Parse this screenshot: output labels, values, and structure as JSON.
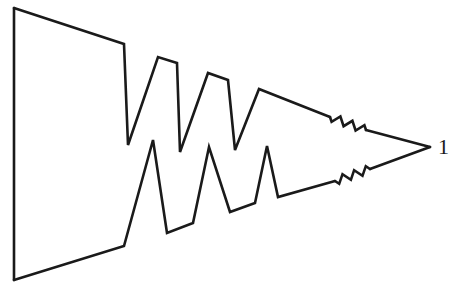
{
  "diagram": {
    "type": "line-drawing",
    "stroke_color": "#1a1a1a",
    "background": "#ffffff",
    "label": "1",
    "paths": {
      "top": [
        [
          14,
          8
        ],
        [
          124,
          44
        ],
        [
          128,
          145
        ],
        [
          158,
          57
        ],
        [
          177,
          63
        ],
        [
          180,
          152
        ],
        [
          208,
          73
        ],
        [
          228,
          80
        ],
        [
          235,
          150
        ],
        [
          259,
          89
        ],
        [
          330,
          117
        ]
      ],
      "top_spring": {
        "from": [
          330,
          117
        ],
        "to": [
          366,
          130
        ],
        "teeth": 3
      },
      "top_tail": [
        [
          366,
          130
        ],
        [
          430,
          147
        ]
      ],
      "bottom": [
        [
          14,
          280
        ],
        [
          124,
          246
        ],
        [
          153,
          140
        ],
        [
          167,
          233
        ],
        [
          193,
          223
        ],
        [
          209,
          147
        ],
        [
          230,
          212
        ],
        [
          255,
          203
        ],
        [
          267,
          146
        ],
        [
          278,
          197
        ],
        [
          335,
          181
        ]
      ],
      "bottom_spring": {
        "from": [
          335,
          181
        ],
        "to": [
          370,
          169
        ],
        "teeth": 3
      },
      "bottom_tail": [
        [
          370,
          169
        ],
        [
          430,
          147
        ]
      ],
      "left_edge": [
        [
          14,
          8
        ],
        [
          14,
          280
        ]
      ]
    },
    "label_position": [
      438,
      136
    ]
  }
}
